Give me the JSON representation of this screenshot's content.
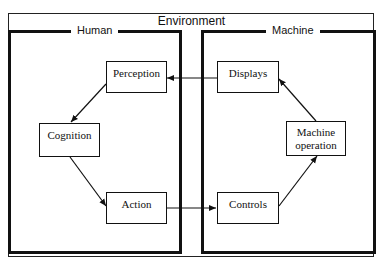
{
  "diagram": {
    "environment_label": "Environment",
    "human": {
      "label": "Human",
      "nodes": {
        "perception": "Perception",
        "cognition": "Cognition",
        "action": "Action"
      }
    },
    "machine": {
      "label": "Machine",
      "nodes": {
        "displays": "Displays",
        "machine_operation": "Machine operation",
        "controls": "Controls"
      }
    },
    "edges": [
      {
        "from": "Displays",
        "to": "Perception"
      },
      {
        "from": "Perception",
        "to": "Cognition"
      },
      {
        "from": "Cognition",
        "to": "Action"
      },
      {
        "from": "Action",
        "to": "Controls"
      },
      {
        "from": "Controls",
        "to": "Machine operation"
      },
      {
        "from": "Machine operation",
        "to": "Displays"
      }
    ],
    "colors": {
      "line": "#111111",
      "background": "#ffffff"
    }
  }
}
